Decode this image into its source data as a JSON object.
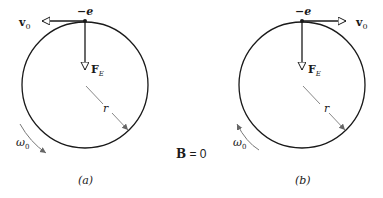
{
  "figure": {
    "colors": {
      "line": "#1a1a1a",
      "radius_line": "#888888",
      "omega_arrow": "#777777"
    },
    "center_label": {
      "bold": "B",
      "rest": " = 0"
    },
    "panels": [
      {
        "id": "a",
        "caption": "(a)",
        "charge_label": "−e",
        "velocity_label": "v",
        "velocity_sub": "0",
        "velocity_direction": "left",
        "force_label": "F",
        "force_sub": "E",
        "radius_label": "r",
        "omega_label": "ω",
        "omega_sub": "0",
        "rotation": "clockwise"
      },
      {
        "id": "b",
        "caption": "(b)",
        "charge_label": "−e",
        "velocity_label": "v",
        "velocity_sub": "0",
        "velocity_direction": "right",
        "force_label": "F",
        "force_sub": "E",
        "radius_label": "r",
        "omega_label": "ω",
        "omega_sub": "0",
        "rotation": "counterclockwise"
      }
    ]
  }
}
